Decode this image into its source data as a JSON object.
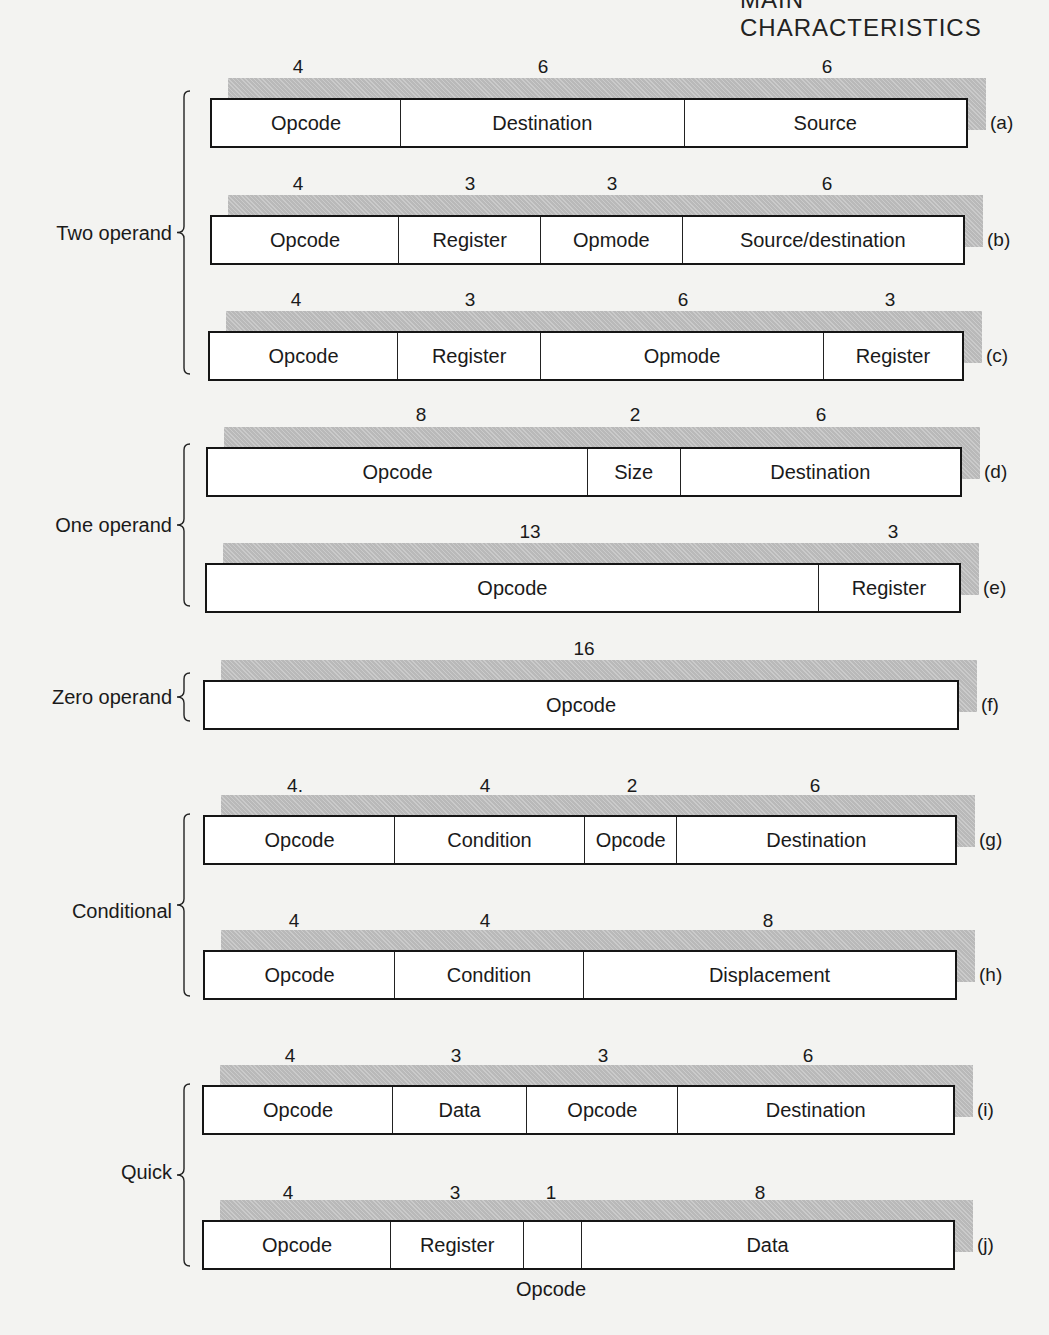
{
  "header": {
    "title": "MAIN CHARACTERISTICS"
  },
  "groups": [
    {
      "label": "Two operand",
      "y": 233,
      "brace_top": 90,
      "brace_bottom": 375
    },
    {
      "label": "One operand",
      "y": 525,
      "brace_top": 443,
      "brace_bottom": 607
    },
    {
      "label": "Zero operand",
      "y": 697,
      "brace_top": 672,
      "brace_bottom": 722
    },
    {
      "label": "Conditional",
      "y": 911,
      "brace_top": 813,
      "brace_bottom": 997
    },
    {
      "label": "Quick",
      "y": 1172,
      "brace_top": 1083,
      "brace_bottom": 1267
    }
  ],
  "formats": [
    {
      "tag": "(a)",
      "bits": [
        "4",
        "6",
        "6"
      ],
      "fields": [
        "Opcode",
        "Destination",
        "Source"
      ]
    },
    {
      "tag": "(b)",
      "bits": [
        "4",
        "3",
        "3",
        "6"
      ],
      "fields": [
        "Opcode",
        "Register",
        "Opmode",
        "Source/destination"
      ]
    },
    {
      "tag": "(c)",
      "bits": [
        "4",
        "3",
        "6",
        "3"
      ],
      "fields": [
        "Opcode",
        "Register",
        "Opmode",
        "Register"
      ]
    },
    {
      "tag": "(d)",
      "bits": [
        "8",
        "2",
        "6"
      ],
      "fields": [
        "Opcode",
        "Size",
        "Destination"
      ]
    },
    {
      "tag": "(e)",
      "bits": [
        "13",
        "3"
      ],
      "fields": [
        "Opcode",
        "Register"
      ]
    },
    {
      "tag": "(f)",
      "bits": [
        "16"
      ],
      "fields": [
        "Opcode"
      ]
    },
    {
      "tag": "(g)",
      "bits": [
        "4.",
        "4",
        "2",
        "6"
      ],
      "fields": [
        "Opcode",
        "Condition",
        "Opcode",
        "Destination"
      ]
    },
    {
      "tag": "(h)",
      "bits": [
        "4",
        "4",
        "8"
      ],
      "fields": [
        "Opcode",
        "Condition",
        "Displacement"
      ]
    },
    {
      "tag": "(i)",
      "bits": [
        "4",
        "3",
        "3",
        "6"
      ],
      "fields": [
        "Opcode",
        "Data",
        "Opcode",
        "Destination"
      ]
    },
    {
      "tag": "(j)",
      "bits": [
        "4",
        "3",
        "1",
        "8"
      ],
      "fields": [
        "Opcode",
        "Register",
        "",
        "Data"
      ],
      "below_label": "Opcode"
    }
  ]
}
